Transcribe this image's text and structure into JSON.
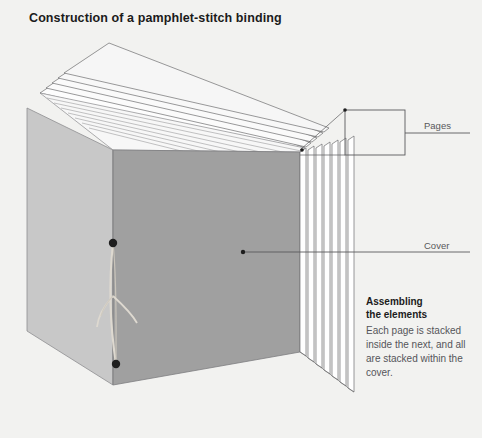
{
  "title": "Construction of a pamphlet-stitch binding",
  "labels": {
    "pages": "Pages",
    "cover": "Cover"
  },
  "note": {
    "heading_line1": "Assembling",
    "heading_line2": "the elements",
    "body": "Each page is stacked inside the next, and all are stacked within the cover."
  },
  "colors": {
    "background": "#f2f2f0",
    "cover_left_panel": "#c8c8c8",
    "cover_right_panel": "#a0a0a0",
    "page_face": "#ffffff",
    "page_edge_line": "#6e6e70",
    "leader_line": "#5a5a5c",
    "thread": "#d8d4cc",
    "knot": "#1e1e1e",
    "title_text": "#1b1b1b",
    "label_text": "#58585a"
  },
  "diagram": {
    "type": "isometric-illustration",
    "subject": "pamphlet-stitch binding",
    "page_leaf_count": 7,
    "stitch": {
      "knots": 2,
      "has_bow": true
    },
    "callout_box": {
      "x": 345,
      "y": 110,
      "width": 60,
      "height": 45
    }
  }
}
